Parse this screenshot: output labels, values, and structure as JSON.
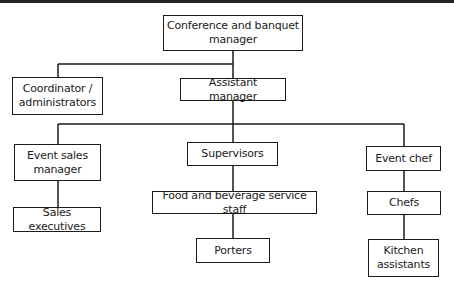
{
  "diagram": {
    "type": "org-chart",
    "line_color": "#1a1a1a",
    "nodes": {
      "conference_manager": "Conference and banquet manager",
      "coordinator": "Coordinator / administrators",
      "assistant_manager": "Assistant manager",
      "event_sales_manager": "Event sales manager",
      "supervisors": "Supervisors",
      "event_chef": "Event chef",
      "sales_executives": "Sales executives",
      "fb_service_staff": "Food and beverage service staff",
      "chefs": "Chefs",
      "porters": "Porters",
      "kitchen_assistants": "Kitchen assistants"
    },
    "edges": [
      [
        "conference_manager",
        "coordinator"
      ],
      [
        "conference_manager",
        "assistant_manager"
      ],
      [
        "assistant_manager",
        "event_sales_manager"
      ],
      [
        "assistant_manager",
        "supervisors"
      ],
      [
        "assistant_manager",
        "event_chef"
      ],
      [
        "event_sales_manager",
        "sales_executives"
      ],
      [
        "supervisors",
        "fb_service_staff"
      ],
      [
        "fb_service_staff",
        "porters"
      ],
      [
        "event_chef",
        "chefs"
      ],
      [
        "chefs",
        "kitchen_assistants"
      ]
    ]
  }
}
